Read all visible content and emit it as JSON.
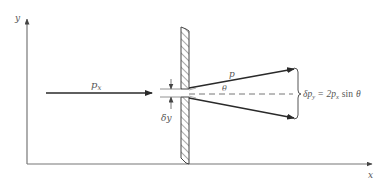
{
  "diagram": {
    "axes": {
      "x_label": "x",
      "y_label": "y"
    },
    "incident_momentum_label": "p",
    "incident_momentum_subscript": "x",
    "slit_width_label": "δy",
    "diffracted_momentum_label": "p",
    "angle_label": "θ",
    "uncertainty_equation": {
      "lhs_symbol": "δp",
      "lhs_subscript": "y",
      "equals": "=",
      "coefficient": "2p",
      "coef_subscript": "x",
      "function": "sin",
      "argument": "θ"
    },
    "colors": {
      "line": "#3a3a3a",
      "axis": "#777777",
      "text": "#555555",
      "dash": "#777777"
    }
  }
}
